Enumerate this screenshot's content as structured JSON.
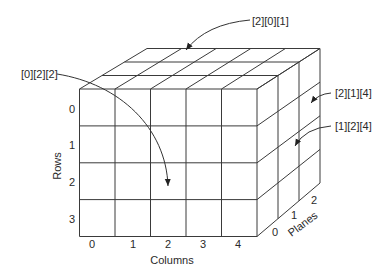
{
  "diagram": {
    "dimensions": {
      "rows": 4,
      "columns": 5,
      "planes": 3
    },
    "axes": {
      "rows": {
        "title": "Rows",
        "ticks": [
          "0",
          "1",
          "2",
          "3"
        ]
      },
      "columns": {
        "title": "Columns",
        "ticks": [
          "0",
          "1",
          "2",
          "3",
          "4"
        ]
      },
      "planes": {
        "title": "Planes",
        "ticks": [
          "0",
          "1",
          "2"
        ]
      }
    },
    "callouts": [
      {
        "label": "[2][0][1]",
        "target": "top face, plane 2, row 0, column 1"
      },
      {
        "label": "[0][2][2]",
        "target": "front face, plane 0, row 2, column 2"
      },
      {
        "label": "[2][1][4]",
        "target": "right face, plane 2, row 1, column 4"
      },
      {
        "label": "[1][2][4]",
        "target": "right face, plane 1, row 2, column 4"
      }
    ],
    "colors": {
      "line": "#3a3a3a",
      "text": "#2a2a2a",
      "background": "#ffffff"
    }
  }
}
